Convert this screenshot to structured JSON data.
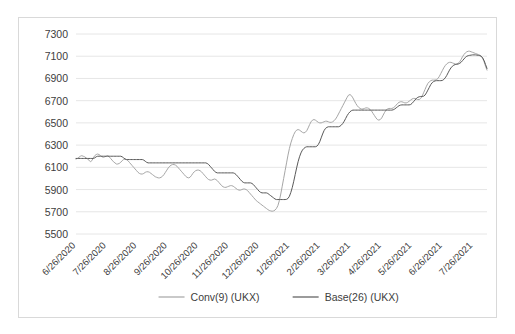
{
  "chart_data": {
    "type": "line",
    "title": "",
    "xlabel": "",
    "ylabel": "",
    "ylim": [
      5500,
      7300
    ],
    "ytick_step": 200,
    "ytick_labels": [
      "7300",
      "7100",
      "6900",
      "6700",
      "6500",
      "6300",
      "6100",
      "5900",
      "5700",
      "5500"
    ],
    "grid": true,
    "legend_position": "bottom",
    "x_tick_labels": [
      "6/26/2020",
      "7/26/2020",
      "8/26/2020",
      "9/26/2020",
      "10/26/2020",
      "11/26/2020",
      "12/26/2020",
      "1/26/2021",
      "2/26/2021",
      "3/26/2021",
      "4/26/2021",
      "5/26/2021",
      "6/26/2021",
      "7/26/2021"
    ],
    "x_index_max": 285,
    "series": [
      {
        "name": "Conv(9) (UKX)",
        "color": "#a6a6a6",
        "values": [
          6175,
          6180,
          6190,
          6200,
          6205,
          6200,
          6195,
          6185,
          6175,
          6165,
          6150,
          6160,
          6185,
          6205,
          6215,
          6220,
          6215,
          6205,
          6195,
          6190,
          6195,
          6200,
          6205,
          6195,
          6180,
          6165,
          6150,
          6140,
          6130,
          6130,
          6135,
          6145,
          6160,
          6170,
          6175,
          6170,
          6160,
          6145,
          6130,
          6115,
          6100,
          6085,
          6070,
          6055,
          6045,
          6040,
          6040,
          6045,
          6055,
          6060,
          6060,
          6055,
          6045,
          6035,
          6025,
          6015,
          6010,
          6005,
          6005,
          6010,
          6020,
          6035,
          6055,
          6075,
          6095,
          6110,
          6120,
          6125,
          6125,
          6120,
          6110,
          6095,
          6080,
          6065,
          6050,
          6035,
          6020,
          6010,
          6005,
          6010,
          6025,
          6045,
          6060,
          6070,
          6075,
          6075,
          6070,
          6060,
          6045,
          6030,
          6015,
          6000,
          5990,
          5985,
          5985,
          5990,
          5995,
          5990,
          5980,
          5965,
          5950,
          5935,
          5925,
          5920,
          5920,
          5925,
          5930,
          5935,
          5935,
          5930,
          5920,
          5910,
          5900,
          5895,
          5895,
          5900,
          5905,
          5905,
          5900,
          5890,
          5875,
          5860,
          5845,
          5830,
          5815,
          5800,
          5790,
          5780,
          5770,
          5760,
          5750,
          5740,
          5730,
          5720,
          5712,
          5708,
          5705,
          5708,
          5715,
          5730,
          5755,
          5800,
          5860,
          5930,
          6000,
          6070,
          6140,
          6210,
          6270,
          6320,
          6360,
          6395,
          6420,
          6435,
          6440,
          6435,
          6425,
          6415,
          6410,
          6415,
          6430,
          6455,
          6485,
          6510,
          6525,
          6530,
          6525,
          6515,
          6505,
          6500,
          6500,
          6505,
          6510,
          6515,
          6515,
          6510,
          6505,
          6505,
          6510,
          6520,
          6535,
          6555,
          6580,
          6605,
          6630,
          6655,
          6680,
          6705,
          6730,
          6750,
          6755,
          6745,
          6725,
          6700,
          6675,
          6655,
          6640,
          6630,
          6625,
          6625,
          6630,
          6635,
          6635,
          6630,
          6620,
          6605,
          6585,
          6565,
          6545,
          6530,
          6525,
          6530,
          6545,
          6570,
          6595,
          6615,
          6625,
          6630,
          6630,
          6630,
          6635,
          6645,
          6660,
          6675,
          6685,
          6690,
          6690,
          6685,
          6680,
          6680,
          6685,
          6695,
          6705,
          6715,
          6720,
          6720,
          6715,
          6710,
          6710,
          6720,
          6740,
          6770,
          6800,
          6830,
          6855,
          6870,
          6880,
          6885,
          6885,
          6885,
          6890,
          6900,
          6920,
          6945,
          6970,
          6995,
          7015,
          7030,
          7040,
          7045,
          7045,
          7040,
          7035,
          7030,
          7030,
          7035,
          7050,
          7070,
          7095,
          7115,
          7130,
          7140,
          7145,
          7145,
          7140,
          7135,
          7130,
          7125,
          7120,
          7115,
          7110,
          7100,
          7080,
          7050,
          7010,
          6975
        ]
      },
      {
        "name": "Base(26) (UKX)",
        "color": "#595959",
        "values": [
          6180,
          6180,
          6180,
          6180,
          6180,
          6180,
          6180,
          6180,
          6180,
          6180,
          6180,
          6180,
          6180,
          6185,
          6195,
          6200,
          6200,
          6200,
          6200,
          6200,
          6200,
          6200,
          6200,
          6200,
          6200,
          6200,
          6200,
          6200,
          6200,
          6200,
          6200,
          6200,
          6195,
          6185,
          6175,
          6170,
          6170,
          6170,
          6170,
          6170,
          6170,
          6170,
          6170,
          6170,
          6170,
          6170,
          6170,
          6165,
          6155,
          6145,
          6140,
          6140,
          6140,
          6140,
          6140,
          6140,
          6140,
          6140,
          6140,
          6140,
          6140,
          6140,
          6140,
          6140,
          6140,
          6140,
          6140,
          6140,
          6140,
          6140,
          6140,
          6140,
          6140,
          6140,
          6140,
          6140,
          6140,
          6140,
          6140,
          6140,
          6140,
          6140,
          6140,
          6140,
          6140,
          6140,
          6140,
          6140,
          6140,
          6140,
          6140,
          6135,
          6125,
          6110,
          6095,
          6080,
          6065,
          6055,
          6050,
          6050,
          6050,
          6050,
          6050,
          6050,
          6050,
          6050,
          6050,
          6050,
          6050,
          6050,
          6045,
          6035,
          6020,
          6005,
          5990,
          5975,
          5965,
          5960,
          5960,
          5960,
          5960,
          5960,
          5955,
          5945,
          5930,
          5915,
          5900,
          5885,
          5875,
          5870,
          5870,
          5870,
          5870,
          5865,
          5855,
          5845,
          5835,
          5825,
          5815,
          5810,
          5810,
          5810,
          5810,
          5810,
          5810,
          5810,
          5812,
          5820,
          5840,
          5875,
          5920,
          5975,
          6035,
          6095,
          6150,
          6195,
          6230,
          6255,
          6270,
          6280,
          6285,
          6285,
          6285,
          6285,
          6285,
          6285,
          6285,
          6290,
          6305,
          6330,
          6365,
          6400,
          6430,
          6450,
          6460,
          6465,
          6465,
          6465,
          6465,
          6465,
          6465,
          6465,
          6465,
          6470,
          6480,
          6495,
          6515,
          6540,
          6565,
          6585,
          6600,
          6610,
          6615,
          6615,
          6615,
          6615,
          6615,
          6615,
          6615,
          6615,
          6615,
          6615,
          6615,
          6615,
          6615,
          6615,
          6615,
          6615,
          6615,
          6615,
          6615,
          6615,
          6615,
          6615,
          6615,
          6615,
          6615,
          6615,
          6615,
          6615,
          6618,
          6625,
          6635,
          6645,
          6655,
          6660,
          6662,
          6662,
          6662,
          6662,
          6662,
          6662,
          6665,
          6675,
          6690,
          6705,
          6720,
          6730,
          6735,
          6738,
          6738,
          6740,
          6750,
          6770,
          6795,
          6820,
          6845,
          6862,
          6872,
          6878,
          6880,
          6880,
          6880,
          6880,
          6882,
          6890,
          6905,
          6925,
          6950,
          6975,
          6995,
          7010,
          7020,
          7025,
          7028,
          7030,
          7035,
          7045,
          7060,
          7075,
          7090,
          7100,
          7105,
          7108,
          7110,
          7112,
          7112,
          7112,
          7110,
          7108,
          7105,
          7100,
          7085,
          7060,
          7025,
          6990
        ]
      }
    ]
  },
  "legend": {
    "items": [
      {
        "label": "Conv(9) (UKX)",
        "color": "#a6a6a6"
      },
      {
        "label": "Base(26) (UKX)",
        "color": "#595959"
      }
    ]
  }
}
